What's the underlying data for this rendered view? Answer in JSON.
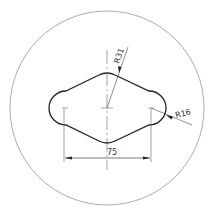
{
  "drawing": {
    "type": "technical-drawing",
    "view": "slot-plate-top-view",
    "dimensions": {
      "center_distance": "75",
      "large_radius": "R31",
      "small_radius": "R16"
    },
    "colors": {
      "background": "#ffffff",
      "outline": "#222222",
      "thin_line": "#666666",
      "circle": "#888888"
    }
  }
}
